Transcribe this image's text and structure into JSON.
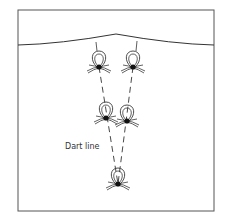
{
  "figure": {
    "label_dart_line": "Dart line",
    "stroke_color": "#3a3a3a",
    "knot_color": "#111111",
    "frame": {
      "x": 18,
      "y": 10,
      "w": 196,
      "h": 201
    },
    "knots": [
      {
        "name": "top-left",
        "x": 99,
        "y": 67
      },
      {
        "name": "top-right",
        "x": 133,
        "y": 67
      },
      {
        "name": "middle-left",
        "x": 106,
        "y": 118
      },
      {
        "name": "middle-right",
        "x": 127,
        "y": 121
      },
      {
        "name": "bottom-point",
        "x": 118,
        "y": 184
      }
    ]
  }
}
